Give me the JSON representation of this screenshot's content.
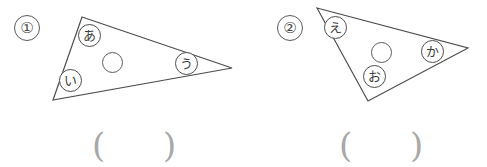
{
  "page": {
    "width": 487,
    "height": 167,
    "background_color": "#ffffff",
    "ink_color": "#4d4d4d",
    "paren_color": "#a8a8a8"
  },
  "figures": [
    {
      "index_label": "①",
      "triangle": {
        "vertices": [
          {
            "x": 82,
            "y": 17
          },
          {
            "x": 232,
            "y": 68
          },
          {
            "x": 53,
            "y": 100
          }
        ],
        "stroke_color": "#4d4d4d"
      },
      "inner_circle": {
        "cx": 112,
        "cy": 62,
        "r": 10.5
      },
      "vertex_labels": [
        {
          "text": "あ",
          "x": 78,
          "y": 24
        },
        {
          "text": "い",
          "x": 59,
          "y": 69
        },
        {
          "text": "う",
          "x": 175,
          "y": 52
        }
      ],
      "answer_field": {
        "open": "(",
        "close": ")",
        "open_x": 92,
        "close_x": 163,
        "y": 128
      }
    },
    {
      "index_label": "②",
      "triangle": {
        "vertices": [
          {
            "x": 317,
            "y": 8
          },
          {
            "x": 468,
            "y": 48
          },
          {
            "x": 368,
            "y": 101
          }
        ],
        "stroke_color": "#4d4d4d"
      },
      "inner_circle": {
        "cx": 381,
        "cy": 52,
        "r": 10.5
      },
      "vertex_labels": [
        {
          "text": "え",
          "x": 324,
          "y": 16
        },
        {
          "text": "お",
          "x": 363,
          "y": 65
        },
        {
          "text": "か",
          "x": 421,
          "y": 40
        }
      ],
      "answer_field": {
        "open": "(",
        "close": ")",
        "open_x": 339,
        "close_x": 410,
        "y": 128
      }
    }
  ]
}
